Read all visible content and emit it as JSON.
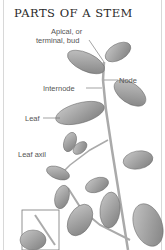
{
  "title": "PARTS OF A STEM",
  "labels": {
    "apical_line1": "Apical, or",
    "apical_line2": "terminal, bud",
    "node": "Node",
    "internode": "Internode",
    "leaf": "Leaf",
    "leaf_axil": "Leaf axil"
  },
  "colors": {
    "text": "#555555",
    "leaf": "#9a9a9a",
    "stem": "#b0b0b0"
  }
}
